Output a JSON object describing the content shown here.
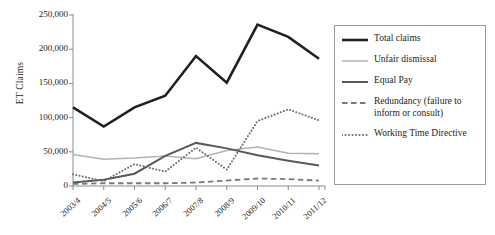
{
  "chart_data": {
    "type": "line",
    "title": "",
    "xlabel": "",
    "ylabel": "ET Claims",
    "categories": [
      "2003/4",
      "2004/5",
      "2005/6",
      "2006/7",
      "2007/8",
      "2008/9",
      "2009/10",
      "2010/11",
      "2011/12"
    ],
    "ylim": [
      0,
      250000
    ],
    "ytick_labels": [
      "250,000",
      "200,000",
      "150,000",
      "100,000",
      "50,000",
      "0"
    ],
    "ytick_values": [
      250000,
      200000,
      150000,
      100000,
      50000,
      0
    ],
    "grid": false,
    "legend_position": "right",
    "series": [
      {
        "name": "Total claims",
        "style": "solid",
        "color": "#231f20",
        "width": 2.6,
        "values": [
          115000,
          87000,
          115000,
          132000,
          190000,
          151000,
          236000,
          218000,
          186000
        ]
      },
      {
        "name": "Unfair dismissal",
        "style": "solid",
        "color": "#b3b3b3",
        "width": 1.5,
        "values": [
          46000,
          39000,
          41000,
          44000,
          40000,
          52000,
          57000,
          48000,
          47000
        ]
      },
      {
        "name": "Equal Pay",
        "style": "solid",
        "color": "#5a5a5a",
        "width": 2.0,
        "values": [
          5000,
          9000,
          18000,
          44000,
          63000,
          55000,
          45000,
          37000,
          30000
        ]
      },
      {
        "name": "Redundancy (failure to inform or consult)",
        "style": "dashed",
        "color": "#7a7a7a",
        "width": 1.8,
        "values": [
          3000,
          4000,
          4000,
          4000,
          5000,
          8000,
          11000,
          10000,
          8000
        ]
      },
      {
        "name": "Working Time Directive",
        "style": "dotted",
        "color": "#6e6e6e",
        "width": 2.0,
        "values": [
          17000,
          7000,
          32000,
          21000,
          56000,
          24000,
          95000,
          112000,
          96000
        ]
      }
    ]
  },
  "axis": {
    "y_title": "ET Claims"
  },
  "legend": {
    "items": [
      {
        "label": "Total claims",
        "swatch": "thick-black-solid-line-icon"
      },
      {
        "label": "Unfair dismissal",
        "swatch": "light-gray-solid-line-icon"
      },
      {
        "label": "Equal Pay",
        "swatch": "dark-gray-solid-line-icon"
      },
      {
        "label": "Redundancy (failure to inform or consult)",
        "swatch": "gray-dashed-line-icon"
      },
      {
        "label": "Working Time Directive",
        "swatch": "gray-dotted-line-icon"
      }
    ]
  }
}
